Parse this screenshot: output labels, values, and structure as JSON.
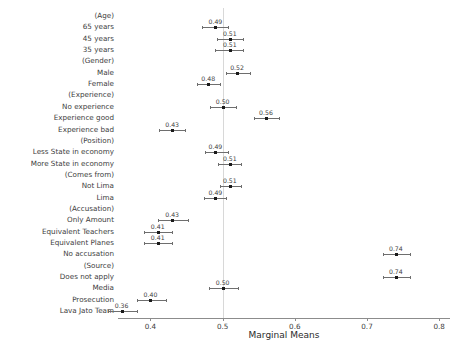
{
  "chart_data": {
    "type": "scatter",
    "title": "",
    "xlabel": "Marginal Means",
    "ylabel": "",
    "xlim": [
      0.355,
      0.815
    ],
    "xticks": [
      0.4,
      0.5,
      0.6,
      0.7,
      0.8
    ],
    "xticklabels": [
      "0.4",
      "0.5",
      "0.6",
      "0.7",
      "0.8"
    ],
    "grid": false,
    "reference_line": 0.5,
    "legend": "none",
    "orientation": "horizontal",
    "categories": [
      "(Age)",
      "65 years",
      "45 years",
      "35 years",
      "(Gender)",
      "Male",
      "Female",
      "(Experience)",
      "No experience",
      "Experience good",
      "Experience bad",
      "(Position)",
      "Less State in economy",
      "More State in economy",
      "(Comes from)",
      "Not Lima",
      "Lima",
      "(Accusation)",
      "Only Amount",
      "Equivalent Teachers",
      "Equivalent Planes",
      "No accusation",
      "(Source)",
      "Does not apply",
      "Media",
      "Prosecution",
      "Lava Jato Team"
    ],
    "points": [
      {
        "label": "(Age)",
        "group": true,
        "value": null,
        "value_label": "",
        "lo": null,
        "hi": null
      },
      {
        "label": "65 years",
        "group": false,
        "value": 0.49,
        "value_label": "0.49",
        "lo": 0.472,
        "hi": 0.508
      },
      {
        "label": "45 years",
        "group": false,
        "value": 0.51,
        "value_label": "0.51",
        "lo": 0.492,
        "hi": 0.528
      },
      {
        "label": "35 years",
        "group": false,
        "value": 0.51,
        "value_label": "0.51",
        "lo": 0.489,
        "hi": 0.528
      },
      {
        "label": "(Gender)",
        "group": true,
        "value": null,
        "value_label": "",
        "lo": null,
        "hi": null
      },
      {
        "label": "Male",
        "group": false,
        "value": 0.52,
        "value_label": "0.52",
        "lo": 0.505,
        "hi": 0.538
      },
      {
        "label": "Female",
        "group": false,
        "value": 0.48,
        "value_label": "0.48",
        "lo": 0.465,
        "hi": 0.497
      },
      {
        "label": "(Experience)",
        "group": true,
        "value": null,
        "value_label": "",
        "lo": null,
        "hi": null
      },
      {
        "label": "No experience",
        "group": false,
        "value": 0.5,
        "value_label": "0.50",
        "lo": 0.483,
        "hi": 0.518
      },
      {
        "label": "Experience good",
        "group": false,
        "value": 0.56,
        "value_label": "0.56",
        "lo": 0.543,
        "hi": 0.578
      },
      {
        "label": "Experience bad",
        "group": false,
        "value": 0.43,
        "value_label": "0.43",
        "lo": 0.412,
        "hi": 0.448
      },
      {
        "label": "(Position)",
        "group": true,
        "value": null,
        "value_label": "",
        "lo": null,
        "hi": null
      },
      {
        "label": "Less State in economy",
        "group": false,
        "value": 0.49,
        "value_label": "0.49",
        "lo": 0.475,
        "hi": 0.507
      },
      {
        "label": "More State in economy",
        "group": false,
        "value": 0.51,
        "value_label": "0.51",
        "lo": 0.494,
        "hi": 0.526
      },
      {
        "label": "(Comes from)",
        "group": true,
        "value": null,
        "value_label": "",
        "lo": null,
        "hi": null
      },
      {
        "label": "Not Lima",
        "group": false,
        "value": 0.51,
        "value_label": "0.51",
        "lo": 0.496,
        "hi": 0.525
      },
      {
        "label": "Lima",
        "group": false,
        "value": 0.49,
        "value_label": "0.49",
        "lo": 0.474,
        "hi": 0.504
      },
      {
        "label": "(Accusation)",
        "group": true,
        "value": null,
        "value_label": "",
        "lo": null,
        "hi": null
      },
      {
        "label": "Only Amount",
        "group": false,
        "value": 0.43,
        "value_label": "0.43",
        "lo": 0.41,
        "hi": 0.452
      },
      {
        "label": "Equivalent Teachers",
        "group": false,
        "value": 0.41,
        "value_label": "0.41",
        "lo": 0.391,
        "hi": 0.43
      },
      {
        "label": "Equivalent Planes",
        "group": false,
        "value": 0.41,
        "value_label": "0.41",
        "lo": 0.391,
        "hi": 0.43
      },
      {
        "label": "No accusation",
        "group": false,
        "value": 0.74,
        "value_label": "0.74",
        "lo": 0.722,
        "hi": 0.76
      },
      {
        "label": "(Source)",
        "group": true,
        "value": null,
        "value_label": "",
        "lo": null,
        "hi": null
      },
      {
        "label": "Does not apply",
        "group": false,
        "value": 0.74,
        "value_label": "0.74",
        "lo": 0.722,
        "hi": 0.76
      },
      {
        "label": "Media",
        "group": false,
        "value": 0.5,
        "value_label": "0.50",
        "lo": 0.481,
        "hi": 0.521
      },
      {
        "label": "Prosecution",
        "group": false,
        "value": 0.4,
        "value_label": "0.40",
        "lo": 0.381,
        "hi": 0.421
      },
      {
        "label": "Lava Jato Team",
        "group": false,
        "value": 0.36,
        "value_label": "0.36",
        "lo": 0.341,
        "hi": 0.381
      }
    ]
  },
  "colors": {
    "point": "#1a1a1a",
    "errorbar": "#6e6e6e",
    "reference_line": "#d8d8d8",
    "axis": "#8c8c8c",
    "text": "#3d3d3d"
  }
}
